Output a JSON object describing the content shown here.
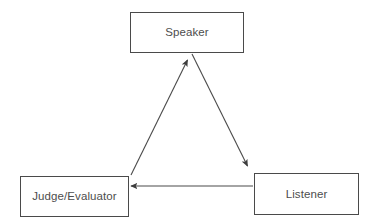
{
  "diagram": {
    "background_color": "#ffffff",
    "stroke_color": "#4a4a4a",
    "text_color": "#4d4d4d",
    "nodes": [
      {
        "id": "speaker",
        "label": "Speaker"
      },
      {
        "id": "judge",
        "label": "Judge/Evaluator"
      },
      {
        "id": "listener",
        "label": "Listener"
      }
    ],
    "edges": [
      {
        "id": "judge-to-speaker",
        "from": "Judge/Evaluator",
        "to": "Speaker",
        "label": "",
        "arrowhead": "end",
        "direction": "up-right"
      },
      {
        "id": "speaker-to-listener",
        "from": "Speaker",
        "to": "Listener",
        "label": "",
        "arrowhead": "end",
        "direction": "down-right"
      },
      {
        "id": "listener-to-judge",
        "from": "Listener",
        "to": "Judge/Evaluator",
        "label": "",
        "arrowhead": "end",
        "direction": "left"
      }
    ]
  }
}
